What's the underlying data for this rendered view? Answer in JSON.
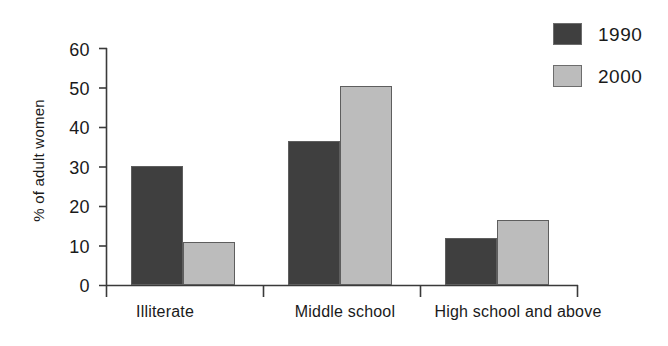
{
  "chart_data": {
    "type": "bar",
    "title": "",
    "subtitle": "",
    "xlabel": "",
    "ylabel": "% of adult women",
    "categories": [
      "Illiterate",
      "Middle school",
      "High school and above"
    ],
    "series": [
      {
        "name": "1990",
        "color": "#3f3f3f",
        "values": [
          30.2,
          36.5,
          12.0
        ]
      },
      {
        "name": "2000",
        "color": "#bcbcbc",
        "values": [
          11.0,
          50.5,
          16.5
        ]
      }
    ],
    "ylim": [
      0,
      60
    ],
    "ytick_labels": [
      "0",
      "10",
      "20",
      "30",
      "40",
      "50",
      "60"
    ],
    "ytick_values": [
      0,
      10,
      20,
      30,
      40,
      50,
      60
    ],
    "grid": false,
    "legend_position": "top-right",
    "annotations": []
  },
  "legend": {
    "items": [
      {
        "label": "1990",
        "swatch_color": "#3f3f3f"
      },
      {
        "label": "2000",
        "swatch_color": "#bcbcbc"
      }
    ]
  },
  "axis": {
    "y_title": "% of adult women",
    "ticks": [
      "60",
      "50",
      "40",
      "30",
      "20",
      "10",
      "0"
    ]
  },
  "categories": {
    "labels": [
      "Illiterate",
      "Middle school",
      "High school and above"
    ]
  },
  "colors": {
    "series_1990": "#3f3f3f",
    "series_2000": "#bcbcbc",
    "axis_line": "#3a3a3a",
    "text": "#1a1a1a",
    "background": "#ffffff"
  }
}
